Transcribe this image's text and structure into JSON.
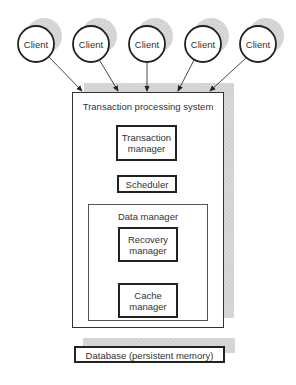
{
  "diagram": {
    "clients": [
      {
        "label": "Client",
        "cx": 36
      },
      {
        "label": "Client",
        "cx": 91
      },
      {
        "label": "Client",
        "cx": 147
      },
      {
        "label": "Client",
        "cx": 203
      },
      {
        "label": "Client",
        "cx": 258
      }
    ],
    "system": {
      "title": "Transaction processing system",
      "transaction_manager": {
        "line1": "Transaction",
        "line2": "manager"
      },
      "scheduler": "Scheduler",
      "data_manager": {
        "title": "Data manager",
        "recovery_manager": {
          "line1": "Recovery",
          "line2": "manager"
        },
        "cache_manager": {
          "line1": "Cache",
          "line2": "manager"
        }
      }
    },
    "database": "Database (persistent memory)",
    "colors": {
      "shadow": "#d4d4d4",
      "stroke": "#222222"
    }
  }
}
